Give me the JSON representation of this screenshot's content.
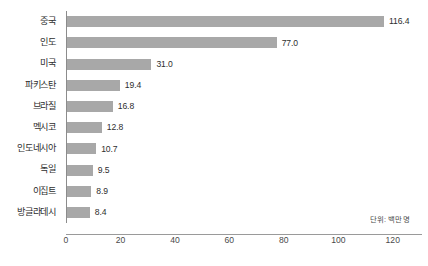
{
  "chart_data": {
    "type": "bar",
    "orientation": "horizontal",
    "title": "",
    "subtitle": "",
    "xlabel": "",
    "ylabel": "",
    "categories": [
      "중국",
      "인도",
      "미국",
      "파키스탄",
      "브라질",
      "멕시코",
      "인도네시아",
      "독일",
      "이집트",
      "방글라데시"
    ],
    "values": [
      116.4,
      77.0,
      31.0,
      19.4,
      16.8,
      12.8,
      10.7,
      9.5,
      8.9,
      8.4
    ],
    "value_labels": [
      "116.4",
      "77.0",
      "31.0",
      "19.4",
      "16.8",
      "12.8",
      "10.7",
      "9.5",
      "8.9",
      "8.4"
    ],
    "xlim": [
      0,
      130
    ],
    "xticks": [
      0,
      20,
      40,
      60,
      80,
      100,
      120
    ],
    "xtick_labels": [
      "0",
      "20",
      "40",
      "60",
      "80",
      "100",
      "120"
    ],
    "grid": false,
    "legend": null,
    "annotation": "단위: 백만 명",
    "bar_color": "#a8a8a8",
    "axis_color": "#8c8c8c",
    "text_color": "#2e2e2e"
  }
}
